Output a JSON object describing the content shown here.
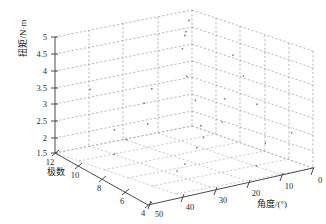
{
  "figure": {
    "kind": "matlab-3d-scatter",
    "background_color": "#ffffff",
    "axis_color": "#4a4a4a",
    "grid_color": "#9a9a9a",
    "point_color": "#7d7d7d"
  },
  "chart_data": {
    "type": "scatter",
    "projection": "3d",
    "title": "",
    "grid": true,
    "legend": null,
    "xlabel": "角度/(°)",
    "ylabel": "极数",
    "zlabel": "扭矩/N·m",
    "xlim": [
      0,
      50
    ],
    "ylim": [
      4,
      12
    ],
    "zlim": [
      1.5,
      5
    ],
    "xticks": [
      0,
      10,
      20,
      30,
      40,
      50
    ],
    "yticks": [
      4,
      6,
      8,
      10,
      12
    ],
    "zticks": [
      1.5,
      2,
      2.5,
      3,
      3.5,
      4,
      4.5,
      5
    ],
    "xtick_labels": [
      "0",
      "10",
      "20",
      "30",
      "40",
      "50"
    ],
    "ytick_labels": [
      "4",
      "6",
      "8",
      "10",
      "12"
    ],
    "ztick_labels": [
      "1.5",
      "2",
      "2.5",
      "3",
      "3.5",
      "4",
      "4.5",
      "5"
    ],
    "points": [
      {
        "x": 3,
        "y": 11.4,
        "z": 4.82
      },
      {
        "x": 7,
        "y": 10.6,
        "z": 4.55
      },
      {
        "x": 13,
        "y": 9.8,
        "z": 4.9
      },
      {
        "x": 18,
        "y": 8.9,
        "z": 4.6
      },
      {
        "x": 24,
        "y": 11.0,
        "z": 4.35
      },
      {
        "x": 29,
        "y": 7.6,
        "z": 4.18
      },
      {
        "x": 34,
        "y": 10.2,
        "z": 4.05
      },
      {
        "x": 41,
        "y": 6.4,
        "z": 3.88
      },
      {
        "x": 46,
        "y": 9.3,
        "z": 3.6
      },
      {
        "x": 6,
        "y": 5.2,
        "z": 3.45
      },
      {
        "x": 11,
        "y": 8.1,
        "z": 3.3
      },
      {
        "x": 17,
        "y": 6.8,
        "z": 3.15
      },
      {
        "x": 22,
        "y": 10.8,
        "z": 3.0
      },
      {
        "x": 27,
        "y": 5.6,
        "z": 2.9
      },
      {
        "x": 33,
        "y": 9.1,
        "z": 2.75
      },
      {
        "x": 38,
        "y": 7.3,
        "z": 2.6
      },
      {
        "x": 44,
        "y": 11.6,
        "z": 2.45
      },
      {
        "x": 48,
        "y": 4.8,
        "z": 2.3
      },
      {
        "x": 9,
        "y": 6.2,
        "z": 2.2
      },
      {
        "x": 15,
        "y": 10.4,
        "z": 2.05
      },
      {
        "x": 21,
        "y": 4.5,
        "z": 1.95
      },
      {
        "x": 26,
        "y": 8.6,
        "z": 1.85
      },
      {
        "x": 31,
        "y": 11.9,
        "z": 1.78
      },
      {
        "x": 37,
        "y": 5.9,
        "z": 1.7
      },
      {
        "x": 43,
        "y": 9.7,
        "z": 1.62
      },
      {
        "x": 2,
        "y": 7.9,
        "z": 1.56
      }
    ]
  }
}
